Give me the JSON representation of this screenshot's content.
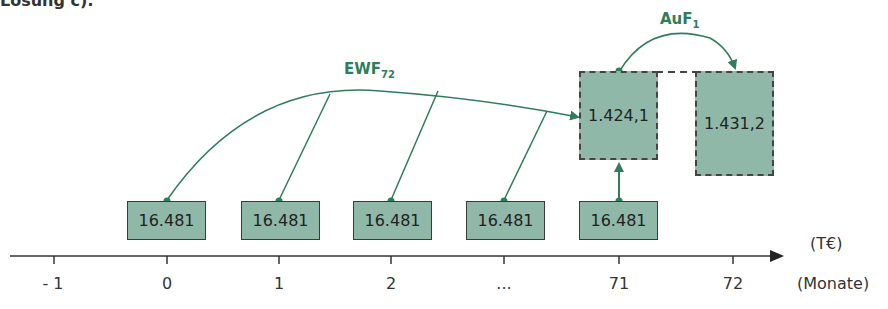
{
  "caption": "Lösung c):",
  "labels": {
    "ewf_base": "EWF",
    "ewf_sub": "72",
    "auf_base": "AuF",
    "auf_sub": "1"
  },
  "payments": [
    {
      "period": "0",
      "value": "16.481"
    },
    {
      "period": "1",
      "value": "16.481"
    },
    {
      "period": "2",
      "value": "16.481"
    },
    {
      "period": "...",
      "value": "16.481"
    },
    {
      "period": "71",
      "value": "16.481"
    }
  ],
  "future_values": [
    {
      "period": "71",
      "value": "1.424,1"
    },
    {
      "period": "72",
      "value": "1.431,2"
    }
  ],
  "axis": {
    "ticks": [
      "- 1",
      "0",
      "1",
      "2",
      "...",
      "71",
      "72"
    ],
    "unit_value": "(T€)",
    "unit_time": "(Monate)"
  },
  "colors": {
    "green": "#2e7d5b",
    "box_fill": "#8fb8a8"
  }
}
